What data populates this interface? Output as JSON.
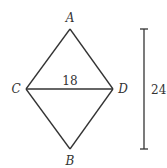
{
  "diagram": {
    "type": "rhombus",
    "vertices": {
      "A": {
        "label": "A",
        "x": 70,
        "y": 29
      },
      "B": {
        "label": "B",
        "x": 70,
        "y": 149
      },
      "C": {
        "label": "C",
        "x": 26,
        "y": 89
      },
      "D": {
        "label": "D",
        "x": 113,
        "y": 89
      }
    },
    "diagonal_CD": {
      "label": "18"
    },
    "dimension_bar": {
      "label": "24",
      "x": 144,
      "y_top": 29,
      "y_bottom": 149
    },
    "colors": {
      "stroke": "#333333",
      "text": "#333333",
      "background": "#ffffff"
    }
  }
}
